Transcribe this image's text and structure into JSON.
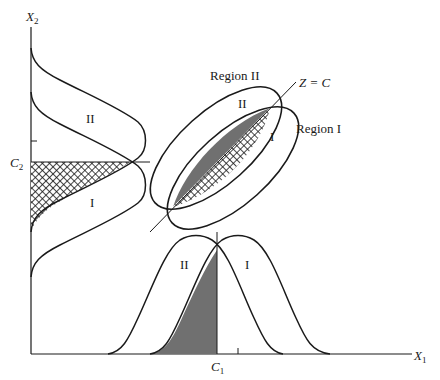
{
  "diagram": {
    "axes": {
      "x_label": "X",
      "x_sub": "1",
      "y_label": "X",
      "y_sub": "2"
    },
    "thresholds": {
      "c1_label": "C",
      "c1_sub": "1",
      "c2_label": "C",
      "c2_sub": "2"
    },
    "discriminant_line_label": "Z = C",
    "regions": {
      "region_one": "Region I",
      "region_two": "Region II"
    },
    "population_labels": {
      "left_upper": "II",
      "left_lower": "I",
      "ellipse_upper": "II",
      "ellipse_lower": "I",
      "bottom_left": "II",
      "bottom_right": "I"
    },
    "colors": {
      "ink": "#1a1a1a",
      "gray_fill": "#707070",
      "background": "#ffffff"
    }
  }
}
